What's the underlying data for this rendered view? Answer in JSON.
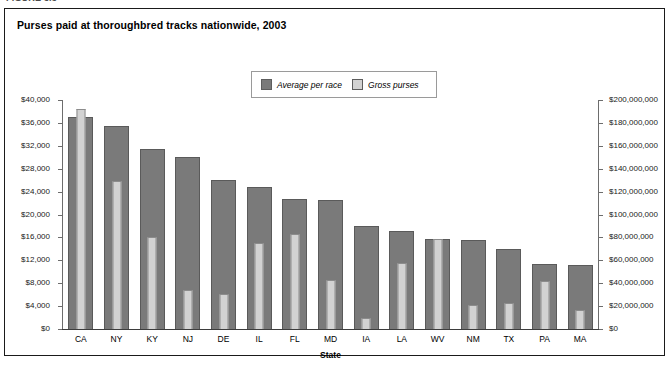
{
  "cutoff_caption": "FIGURE 3.5",
  "chart_title": "Purses paid at thoroughbred tracks nationwide, 2003",
  "legend": {
    "items": [
      {
        "label": "Average per race",
        "color": "#7a7a7a"
      },
      {
        "label": "Gross purses",
        "color": "#d2d2d2"
      }
    ]
  },
  "colors": {
    "average_per_race": "#7a7a7a",
    "gross_purses": "#d2d2d2",
    "frame": "#1a1a1a",
    "axis": "#6d6d6d"
  },
  "chart_data": {
    "type": "bar",
    "title": "Purses paid at thoroughbred tracks nationwide, 2003",
    "xlabel": "State",
    "ylabel": "",
    "grid": false,
    "legend_position": "top-center",
    "categories": [
      "CA",
      "NY",
      "KY",
      "NJ",
      "DE",
      "IL",
      "FL",
      "MD",
      "IA",
      "LA",
      "WV",
      "NM",
      "TX",
      "PA",
      "MA"
    ],
    "series": [
      {
        "name": "Average per race",
        "axis": "left",
        "ylabel": "Average per race",
        "ylim": [
          0,
          40000
        ],
        "ytick_labels": [
          "$0",
          "$4,000",
          "$8,000",
          "$12,000",
          "$16,000",
          "$20,000",
          "$24,000",
          "$28,000",
          "$32,000",
          "$36,000",
          "$40,000"
        ],
        "yticks": [
          0,
          4000,
          8000,
          12000,
          16000,
          20000,
          24000,
          28000,
          32000,
          36000,
          40000
        ],
        "values": [
          37000,
          35500,
          31500,
          30000,
          26000,
          24800,
          22700,
          22600,
          18000,
          17200,
          15800,
          15600,
          14000,
          11400,
          11200
        ]
      },
      {
        "name": "Gross purses",
        "axis": "right",
        "ylabel": "Gross purses",
        "ylim": [
          0,
          200000000
        ],
        "ytick_labels": [
          "$0",
          "$20,000,000",
          "$40,000,000",
          "$60,000,000",
          "$80,000,000",
          "$100,000,000",
          "$120,000,000",
          "$140,000,000",
          "$160,000,000",
          "$180,000,000",
          "$200,000,000"
        ],
        "yticks": [
          0,
          20000000,
          40000000,
          60000000,
          80000000,
          100000000,
          120000000,
          140000000,
          160000000,
          180000000,
          200000000
        ],
        "values": [
          192000000,
          129000000,
          80000000,
          34000000,
          31000000,
          75000000,
          83000000,
          43000000,
          10000000,
          58000000,
          79000000,
          21000000,
          23000000,
          42000000,
          17000000
        ]
      }
    ]
  }
}
